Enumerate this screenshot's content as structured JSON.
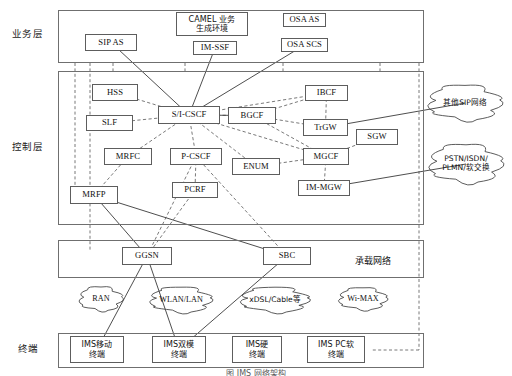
{
  "figure": {
    "caption": "图  IMS 网络架构"
  },
  "layer_labels": [
    {
      "name": "service",
      "text": "业务层",
      "x": 12,
      "y": 26
    },
    {
      "name": "control",
      "text": "控制层",
      "x": 12,
      "y": 139
    },
    {
      "name": "terminal",
      "text": "终端",
      "x": 18,
      "y": 341
    }
  ],
  "layers": [
    {
      "name": "service-layer",
      "x": 58,
      "y": 10,
      "w": 366,
      "h": 53
    },
    {
      "name": "control-layer",
      "x": 58,
      "y": 71,
      "w": 366,
      "h": 154
    },
    {
      "name": "bearer-layer",
      "x": 58,
      "y": 240,
      "w": 366,
      "h": 38
    },
    {
      "name": "terminal-layer",
      "x": 58,
      "y": 333,
      "w": 366,
      "h": 35
    }
  ],
  "inline_captions": [
    {
      "name": "bearer-network-caption",
      "text": "承载网络",
      "x": 355,
      "y": 254
    }
  ],
  "nodes": [
    {
      "id": "sip-as",
      "label": "SIP AS",
      "x": 85,
      "y": 34,
      "w": 52,
      "h": 17,
      "cn": false
    },
    {
      "id": "camel",
      "label": "CAMEL 业务\n生成环境",
      "x": 176,
      "y": 12,
      "w": 72,
      "h": 24,
      "cn": true
    },
    {
      "id": "im-ssf",
      "label": "IM-SSF",
      "x": 193,
      "y": 41,
      "w": 44,
      "h": 14,
      "cn": false
    },
    {
      "id": "osa-as",
      "label": "OSA AS",
      "x": 283,
      "y": 13,
      "w": 43,
      "h": 14,
      "cn": false
    },
    {
      "id": "osa-scs",
      "label": "OSA SCS",
      "x": 281,
      "y": 38,
      "w": 47,
      "h": 14,
      "cn": false
    },
    {
      "id": "hss",
      "label": "HSS",
      "x": 92,
      "y": 84,
      "w": 46,
      "h": 17,
      "cn": false
    },
    {
      "id": "slf",
      "label": "SLF",
      "x": 86,
      "y": 115,
      "w": 47,
      "h": 16,
      "cn": false
    },
    {
      "id": "si-cscf",
      "label": "S/I-CSCF",
      "x": 158,
      "y": 106,
      "w": 62,
      "h": 18,
      "cn": false
    },
    {
      "id": "bgcf",
      "label": "BGCF",
      "x": 228,
      "y": 107,
      "w": 48,
      "h": 17,
      "cn": false
    },
    {
      "id": "ibcf",
      "label": "IBCF",
      "x": 305,
      "y": 85,
      "w": 43,
      "h": 16,
      "cn": false
    },
    {
      "id": "trgw",
      "label": "TrGW",
      "x": 303,
      "y": 119,
      "w": 45,
      "h": 17,
      "cn": false
    },
    {
      "id": "sgw",
      "label": "SGW",
      "x": 356,
      "y": 129,
      "w": 42,
      "h": 16,
      "cn": false
    },
    {
      "id": "mgcf",
      "label": "MGCF",
      "x": 303,
      "y": 148,
      "w": 46,
      "h": 17,
      "cn": false
    },
    {
      "id": "im-mgw",
      "label": "IM-MGW",
      "x": 298,
      "y": 180,
      "w": 52,
      "h": 16,
      "cn": false
    },
    {
      "id": "mrfc",
      "label": "MRFC",
      "x": 104,
      "y": 148,
      "w": 48,
      "h": 17,
      "cn": false
    },
    {
      "id": "p-cscf",
      "label": "P-CSCF",
      "x": 170,
      "y": 148,
      "w": 52,
      "h": 17,
      "cn": false
    },
    {
      "id": "enum",
      "label": "ENUM",
      "x": 232,
      "y": 158,
      "w": 48,
      "h": 17,
      "cn": false
    },
    {
      "id": "pcrf",
      "label": "PCRF",
      "x": 172,
      "y": 182,
      "w": 46,
      "h": 16,
      "cn": false
    },
    {
      "id": "mrfp",
      "label": "MRFP",
      "x": 70,
      "y": 186,
      "w": 48,
      "h": 18,
      "cn": false
    },
    {
      "id": "ggsn",
      "label": "GGSN",
      "x": 122,
      "y": 247,
      "w": 50,
      "h": 18,
      "cn": false
    },
    {
      "id": "sbc",
      "label": "SBC",
      "x": 263,
      "y": 247,
      "w": 48,
      "h": 18,
      "cn": false
    },
    {
      "id": "ims-mobile",
      "label": "IMS移动\n终端",
      "x": 70,
      "y": 336,
      "w": 54,
      "h": 27,
      "cn": true
    },
    {
      "id": "ims-dual",
      "label": "IMS双模\n终端",
      "x": 152,
      "y": 336,
      "w": 54,
      "h": 27,
      "cn": true
    },
    {
      "id": "ims-hard",
      "label": "IMS硬\n终端",
      "x": 232,
      "y": 336,
      "w": 50,
      "h": 27,
      "cn": true
    },
    {
      "id": "ims-pc",
      "label": "IMS PC软\n终端",
      "x": 307,
      "y": 336,
      "w": 58,
      "h": 27,
      "cn": true
    }
  ],
  "clouds": [
    {
      "id": "other-sip",
      "label": "其他SIP网络",
      "cx": 465,
      "cy": 103,
      "rw": 44,
      "rh": 22,
      "cn": true
    },
    {
      "id": "pstn",
      "label": "PSTN/ISDN/\nPLMN/软交换",
      "cx": 466,
      "cy": 164,
      "rw": 44,
      "rh": 24,
      "cn": true
    },
    {
      "id": "ran",
      "label": "RAN",
      "cx": 101,
      "cy": 299,
      "rw": 26,
      "rh": 15,
      "cn": false
    },
    {
      "id": "wlan",
      "label": "WLAN/LAN",
      "cx": 181,
      "cy": 300,
      "rw": 37,
      "rh": 16,
      "cn": false
    },
    {
      "id": "xdsl",
      "label": "xDSL/Cable等",
      "cx": 275,
      "cy": 300,
      "rw": 41,
      "rh": 16,
      "cn": true
    },
    {
      "id": "wimax",
      "label": "Wi-MAX",
      "cx": 363,
      "cy": 299,
      "rw": 29,
      "rh": 14,
      "cn": false
    }
  ],
  "vertical_dashed_buses": [
    {
      "name": "bus-1",
      "x": 75,
      "y1": 63,
      "y2": 190
    },
    {
      "name": "bus-2",
      "x": 90,
      "y1": 63,
      "y2": 252
    },
    {
      "name": "bus-3",
      "x": 113,
      "y1": 63,
      "y2": 71
    },
    {
      "name": "bus-4",
      "x": 185,
      "y1": 63,
      "y2": 71
    },
    {
      "name": "bus-5",
      "x": 283,
      "y1": 63,
      "y2": 71
    },
    {
      "name": "bus-6",
      "x": 380,
      "y1": 63,
      "y2": 71
    },
    {
      "name": "bus-7",
      "x": 419,
      "y1": 63,
      "y2": 350
    }
  ],
  "links_dashed": [
    [
      "hss",
      "si-cscf"
    ],
    [
      "slf",
      "si-cscf"
    ],
    [
      "si-cscf",
      "mrfc"
    ],
    [
      "si-cscf",
      "p-cscf"
    ],
    [
      "si-cscf",
      "enum"
    ],
    [
      "si-cscf",
      "bgcf"
    ],
    [
      "si-cscf",
      "ibcf"
    ],
    [
      "si-cscf",
      "mgcf"
    ],
    [
      "bgcf",
      "ibcf"
    ],
    [
      "bgcf",
      "mgcf"
    ],
    [
      "bgcf",
      "trgw"
    ],
    [
      "ibcf",
      "trgw"
    ],
    [
      "mgcf",
      "sgw"
    ],
    [
      "mgcf",
      "im-mgw"
    ],
    [
      "mrfc",
      "mrfp"
    ],
    [
      "p-cscf",
      "pcrf"
    ],
    [
      "p-cscf",
      "ggsn"
    ],
    [
      "p-cscf",
      "sbc"
    ],
    [
      "pcrf",
      "ggsn"
    ],
    [
      "enum",
      "mgcf"
    ]
  ],
  "links_solid": [
    [
      "sip-as",
      "si-cscf"
    ],
    [
      "im-ssf",
      "si-cscf"
    ],
    [
      "osa-scs",
      "si-cscf"
    ],
    [
      "si-cscf",
      "bgcf"
    ],
    [
      "mrfp",
      "ggsn"
    ],
    [
      "mrfp",
      "sbc"
    ],
    [
      "ggsn",
      "ims-mobile"
    ],
    [
      "ggsn",
      "ims-dual"
    ],
    [
      "sbc",
      "ims-dual"
    ],
    [
      "trgw",
      "other-sip"
    ],
    [
      "im-mgw",
      "pstn"
    ]
  ],
  "colors": {
    "frame_stroke": "#6f6f6f",
    "node_stroke": "#5d5d5d",
    "line_solid": "#3a3a3a",
    "line_dashed": "#6a6a6a",
    "cloud_stroke": "#4a4a4a",
    "text": "#111111",
    "background": "#ffffff"
  }
}
